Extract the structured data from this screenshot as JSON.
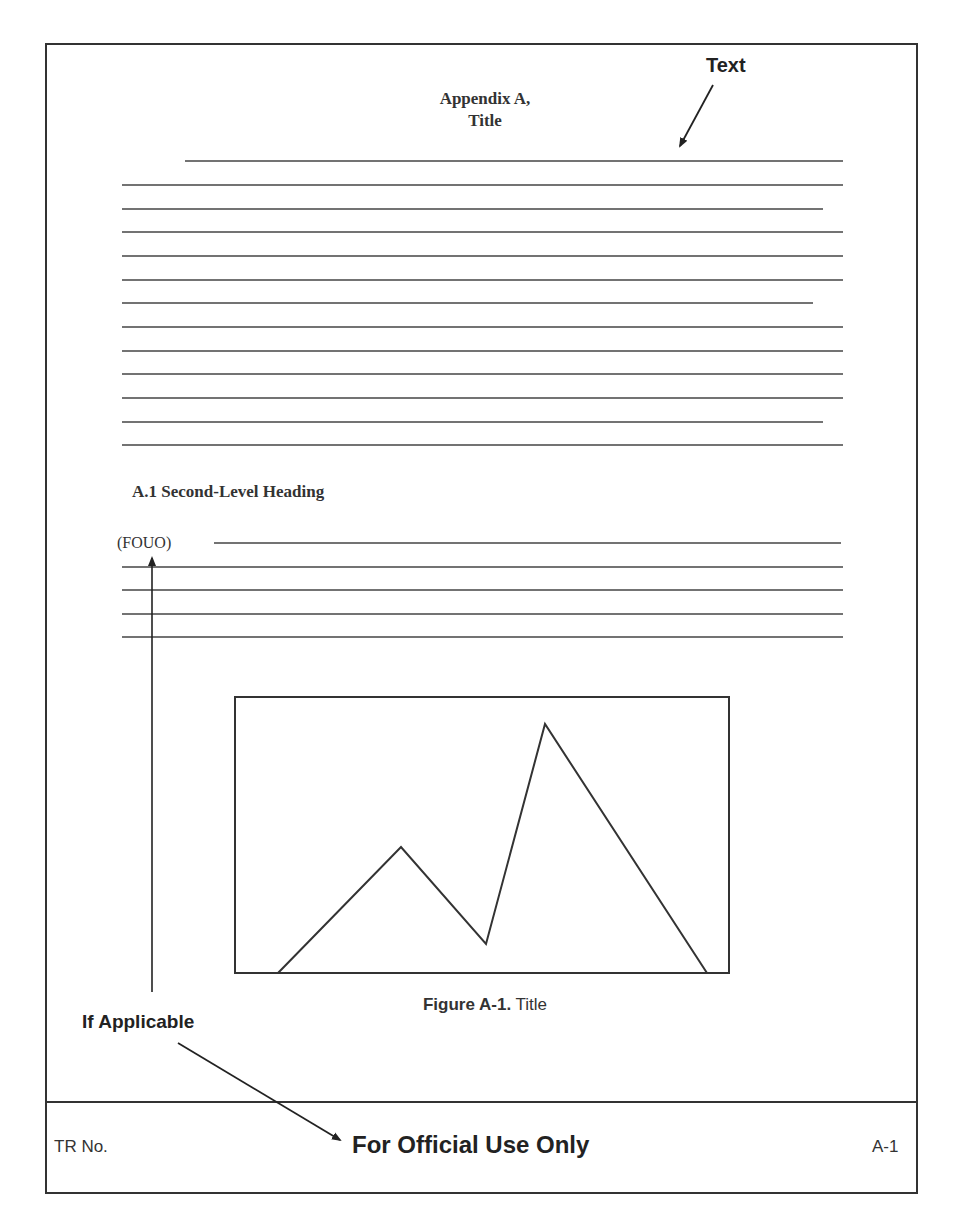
{
  "page": {
    "title_line1": "Appendix A,",
    "title_line2": "Title",
    "callout_text_label": "Text",
    "second_level_heading": "A.1 Second-Level Heading",
    "portion_marking": "(FOUO)",
    "figure_caption_label": "Figure A-1.",
    "figure_caption_title": " Title",
    "callout_if_applicable": "If Applicable"
  },
  "footer": {
    "report_number": "TR No.",
    "classification": "For Official Use Only",
    "page_number": "A-1"
  },
  "colors": {
    "ink": "#333333",
    "background": "#ffffff"
  },
  "placeholder_text_lines": {
    "section_intro_count": 13,
    "section_a1_count": 5
  }
}
